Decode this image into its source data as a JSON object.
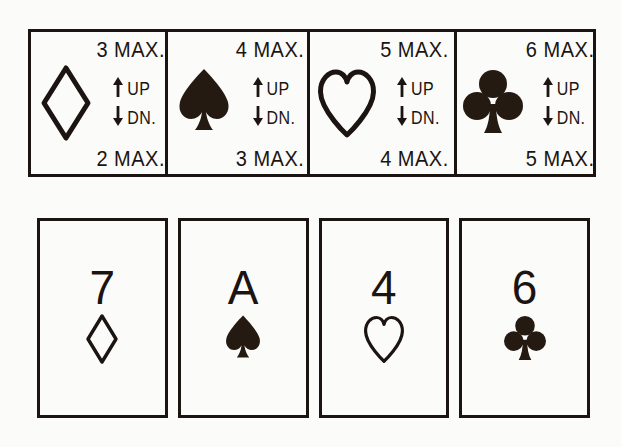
{
  "page": {
    "ink_color": "#1c1410",
    "background_color": "#fbfbfa",
    "up_label": "UP",
    "down_label": "DN."
  },
  "legend": {
    "cells": [
      {
        "suit": "diamond",
        "suit_style": "outline",
        "top_max": "3 MAX.",
        "bottom_max": "2 MAX.",
        "up_label": "UP",
        "down_label": "DN."
      },
      {
        "suit": "spade",
        "suit_style": "filled",
        "top_max": "4 MAX.",
        "bottom_max": "3 MAX.",
        "up_label": "UP",
        "down_label": "DN."
      },
      {
        "suit": "heart",
        "suit_style": "outline",
        "top_max": "5 MAX.",
        "bottom_max": "4 MAX.",
        "up_label": "UP",
        "down_label": "DN."
      },
      {
        "suit": "club",
        "suit_style": "filled",
        "top_max": "6 MAX.",
        "bottom_max": "5 MAX.",
        "up_label": "UP",
        "down_label": "DN."
      }
    ]
  },
  "cards": [
    {
      "rank": "7",
      "suit": "diamond",
      "suit_style": "outline"
    },
    {
      "rank": "A",
      "suit": "spade",
      "suit_style": "filled"
    },
    {
      "rank": "4",
      "suit": "heart",
      "suit_style": "outline"
    },
    {
      "rank": "6",
      "suit": "club",
      "suit_style": "filled"
    }
  ]
}
